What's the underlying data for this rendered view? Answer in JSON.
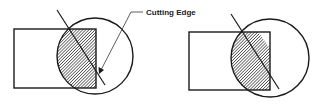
{
  "diagram": {
    "annotation": {
      "label": "Cutting Edge"
    },
    "figures": [
      {
        "name": "left",
        "description": "rectangle overlapped by circle, hatched intersection bounded by straight vertical edge, diagonal cutting line"
      },
      {
        "name": "right",
        "description": "rectangle overlapped by circle, hatched region bounded by diagonal cutting line"
      }
    ],
    "colors": {
      "stroke": "#1a1a1a",
      "hatch": "#333333",
      "background": "#ffffff"
    }
  }
}
